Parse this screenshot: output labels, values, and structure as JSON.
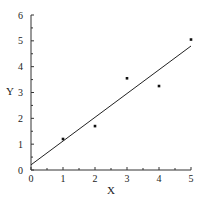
{
  "chart_data": {
    "type": "scatter",
    "title": "",
    "xlabel": "X",
    "ylabel": "Y",
    "xlim": [
      0,
      5
    ],
    "ylim": [
      0,
      6
    ],
    "xticks": [
      "0",
      "1",
      "2",
      "3",
      "4",
      "5"
    ],
    "yticks": [
      "0",
      "1",
      "2",
      "3",
      "4",
      "5",
      "6"
    ],
    "grid": false,
    "legend": null,
    "series": [
      {
        "name": "data",
        "type": "scatter",
        "x": [
          1,
          2,
          3,
          4,
          5
        ],
        "y": [
          1.2,
          1.7,
          3.55,
          3.25,
          5.05
        ]
      },
      {
        "name": "fit",
        "type": "line",
        "x": [
          0,
          5
        ],
        "y": [
          0.2,
          4.8
        ]
      }
    ]
  }
}
